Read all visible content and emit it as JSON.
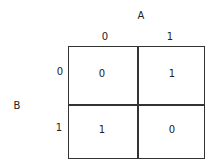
{
  "kmap": {
    "col_var": "A",
    "row_var": "B",
    "col_headers": [
      "0",
      "1"
    ],
    "row_headers": [
      "0",
      "1"
    ],
    "cells": [
      [
        "0",
        "1"
      ],
      [
        "1",
        "0"
      ]
    ]
  }
}
